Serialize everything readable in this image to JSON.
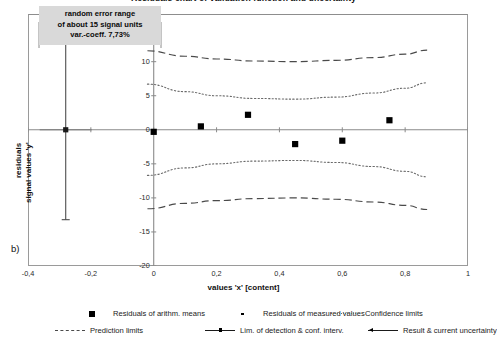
{
  "chart_data": {
    "type": "scatter",
    "title": "Residuals chart of validation function and uncertainty",
    "panel_label": "b)",
    "xlabel": "values 'x' [content]",
    "ylabel_line1": "residuals",
    "ylabel_line2": "signal values 'y'",
    "xlim": [
      -0.4,
      1.0
    ],
    "ylim": [
      -20,
      17
    ],
    "grid": false,
    "xticks": [
      -0.4,
      -0.2,
      0,
      0.2,
      0.4,
      0.6,
      0.8,
      1
    ],
    "xtick_labels": [
      "-0,4",
      "-0,2",
      "0",
      "0,2",
      "0,4",
      "0,6",
      "0,8",
      "1"
    ],
    "yticks": [
      15,
      10,
      5,
      0,
      -5,
      -10,
      -15,
      -20
    ],
    "ytick_labels": [
      "15",
      "10",
      "5",
      "0",
      "-5",
      "-10",
      "-15",
      "-20"
    ],
    "annotation": {
      "line1": "random error range",
      "line2": "of about 15 signal units",
      "line3": "var.-coeff. 7,73%"
    },
    "series": [
      {
        "name": "Residuals of arithm. means",
        "style": "square-marker",
        "points": [
          {
            "x": 0.0,
            "y": -0.3
          },
          {
            "x": 0.15,
            "y": 0.5
          },
          {
            "x": 0.3,
            "y": 2.2
          },
          {
            "x": 0.45,
            "y": -2.1
          },
          {
            "x": 0.6,
            "y": -1.6
          },
          {
            "x": 0.75,
            "y": 1.4
          }
        ]
      },
      {
        "name": "Residuals of measured values",
        "style": "small-dot",
        "points": []
      },
      {
        "name": "Confidence limits",
        "style": "dotted",
        "upper": [
          {
            "x": -0.02,
            "y": 6.7
          },
          {
            "x": 0.1,
            "y": 5.6
          },
          {
            "x": 0.2,
            "y": 5.0
          },
          {
            "x": 0.32,
            "y": 4.6
          },
          {
            "x": 0.45,
            "y": 4.5
          },
          {
            "x": 0.58,
            "y": 4.8
          },
          {
            "x": 0.7,
            "y": 5.4
          },
          {
            "x": 0.8,
            "y": 6.1
          },
          {
            "x": 0.87,
            "y": 6.9
          }
        ],
        "lower": [
          {
            "x": -0.02,
            "y": -6.7
          },
          {
            "x": 0.1,
            "y": -5.6
          },
          {
            "x": 0.2,
            "y": -5.0
          },
          {
            "x": 0.32,
            "y": -4.6
          },
          {
            "x": 0.45,
            "y": -4.5
          },
          {
            "x": 0.58,
            "y": -4.8
          },
          {
            "x": 0.7,
            "y": -5.4
          },
          {
            "x": 0.8,
            "y": -6.1
          },
          {
            "x": 0.87,
            "y": -6.9
          }
        ]
      },
      {
        "name": "Prediction limits",
        "style": "dashed",
        "upper": [
          {
            "x": -0.02,
            "y": 11.6
          },
          {
            "x": 0.1,
            "y": 10.8
          },
          {
            "x": 0.2,
            "y": 10.4
          },
          {
            "x": 0.32,
            "y": 10.1
          },
          {
            "x": 0.45,
            "y": 10.0
          },
          {
            "x": 0.58,
            "y": 10.2
          },
          {
            "x": 0.7,
            "y": 10.6
          },
          {
            "x": 0.8,
            "y": 11.1
          },
          {
            "x": 0.87,
            "y": 11.7
          }
        ],
        "lower": [
          {
            "x": -0.02,
            "y": -11.6
          },
          {
            "x": 0.1,
            "y": -10.8
          },
          {
            "x": 0.2,
            "y": -10.4
          },
          {
            "x": 0.32,
            "y": -10.1
          },
          {
            "x": 0.45,
            "y": -10.0
          },
          {
            "x": 0.58,
            "y": -10.2
          },
          {
            "x": 0.7,
            "y": -10.6
          },
          {
            "x": 0.8,
            "y": -11.1
          },
          {
            "x": 0.87,
            "y": -11.7
          }
        ]
      },
      {
        "name": "Lim. of detection & conf. interv.",
        "style": "solid-with-marker",
        "errorbar": {
          "x": -0.28,
          "y": 0,
          "upper": 13.0,
          "lower": -13.2
        }
      },
      {
        "name": "Result & current uncertainty",
        "style": "solid-with-arrow",
        "points": []
      }
    ],
    "legend": {
      "position": "below",
      "rows": [
        [
          {
            "key": "square",
            "label": "Residuals of arithm. means"
          },
          {
            "key": "dot",
            "label": "Residuals of measured values"
          },
          {
            "key": "dotted",
            "label": "Confidence limits"
          }
        ],
        [
          {
            "key": "dashed",
            "label": "Prediction limits"
          },
          {
            "key": "solid-marker",
            "label": "Lim. of detection & conf. interv."
          },
          {
            "key": "solid-arrow",
            "label": "Result & current uncertainty"
          }
        ]
      ]
    },
    "colors": {
      "axis": "#8a8a8a",
      "frame": "#9a9a9a",
      "marker": "#000000",
      "confidence": "#6a6a6a",
      "prediction": "#4a4a4a",
      "annotation_bg": "#d9d9d9"
    }
  }
}
